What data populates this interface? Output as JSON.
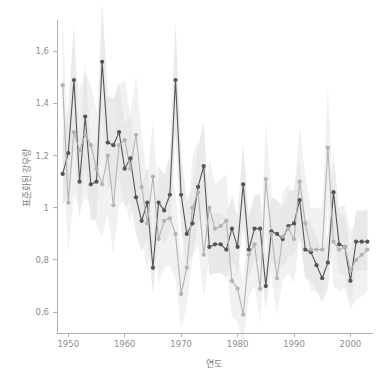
{
  "chart_data": {
    "type": "line",
    "title": "",
    "xlabel": "연도",
    "ylabel": "표준화된 강우량",
    "xlim": [
      1948,
      2004
    ],
    "ylim": [
      0.52,
      1.72
    ],
    "grid": false,
    "legend": "none",
    "decimal_separator": ",",
    "xticks": [
      1950,
      1960,
      1970,
      1980,
      1990,
      2000
    ],
    "xtick_labels": [
      "1950",
      "1960",
      "1970",
      "1980",
      "1990",
      "2000"
    ],
    "yticks": [
      0.6,
      0.8,
      1.0,
      1.2,
      1.4,
      1.6
    ],
    "ytick_labels": [
      "0,6",
      "0,8",
      "1",
      "1,2",
      "1,4",
      "1,6"
    ],
    "x": [
      1949,
      1950,
      1951,
      1952,
      1953,
      1954,
      1955,
      1956,
      1957,
      1958,
      1959,
      1960,
      1961,
      1962,
      1963,
      1964,
      1965,
      1966,
      1967,
      1968,
      1969,
      1970,
      1971,
      1972,
      1973,
      1974,
      1975,
      1976,
      1977,
      1978,
      1979,
      1980,
      1981,
      1982,
      1983,
      1984,
      1985,
      1986,
      1987,
      1988,
      1989,
      1990,
      1991,
      1992,
      1993,
      1994,
      1995,
      1996,
      1997,
      1998,
      1999,
      2000,
      2001,
      2002,
      2003
    ],
    "series": [
      {
        "name": "관측",
        "color": "#555555",
        "band_color": "#d8d8d8",
        "marker": "circle",
        "values": [
          1.13,
          1.21,
          1.49,
          1.1,
          1.35,
          1.09,
          1.1,
          1.56,
          1.25,
          1.24,
          1.29,
          1.15,
          1.19,
          1.04,
          0.95,
          1.02,
          0.77,
          1.02,
          0.99,
          1.05,
          1.49,
          1.05,
          0.9,
          0.94,
          1.08,
          1.16,
          0.85,
          0.86,
          0.86,
          0.84,
          0.92,
          0.85,
          1.09,
          0.84,
          0.92,
          0.92,
          0.7,
          0.91,
          0.9,
          0.88,
          0.93,
          0.94,
          1.03,
          0.84,
          0.83,
          0.78,
          0.73,
          0.79,
          1.06,
          0.86,
          0.85,
          0.72,
          0.87,
          0.87,
          0.87
        ],
        "band_lower": [
          1.01,
          1.05,
          1.28,
          0.96,
          1.16,
          0.95,
          0.96,
          1.33,
          1.08,
          1.07,
          1.12,
          1.0,
          1.03,
          0.9,
          0.83,
          0.89,
          0.67,
          0.89,
          0.86,
          0.91,
          1.28,
          0.91,
          0.78,
          0.82,
          0.94,
          1.0,
          0.74,
          0.75,
          0.75,
          0.73,
          0.8,
          0.74,
          0.94,
          0.73,
          0.8,
          0.8,
          0.61,
          0.79,
          0.78,
          0.77,
          0.81,
          0.82,
          0.89,
          0.73,
          0.72,
          0.68,
          0.64,
          0.69,
          0.92,
          0.75,
          0.74,
          0.63,
          0.76,
          0.76,
          0.76
        ],
        "band_upper": [
          1.26,
          1.38,
          1.71,
          1.25,
          1.55,
          1.24,
          1.25,
          1.79,
          1.43,
          1.42,
          1.48,
          1.32,
          1.36,
          1.19,
          1.08,
          1.16,
          0.88,
          1.16,
          1.13,
          1.2,
          1.71,
          1.2,
          1.03,
          1.07,
          1.23,
          1.33,
          0.97,
          0.98,
          0.98,
          0.96,
          1.05,
          0.97,
          1.25,
          0.96,
          1.05,
          1.05,
          0.8,
          1.04,
          1.03,
          1.0,
          1.06,
          1.07,
          1.18,
          0.96,
          0.95,
          0.89,
          0.83,
          0.9,
          1.21,
          0.98,
          0.97,
          0.82,
          0.99,
          0.99,
          0.99
        ]
      },
      {
        "name": "모의",
        "color": "#b3b3b3",
        "band_color": "#e6e6e6",
        "marker": "circle",
        "values": [
          1.47,
          1.02,
          1.29,
          1.22,
          1.28,
          1.24,
          1.15,
          1.09,
          1.2,
          1.01,
          1.24,
          1.26,
          1.15,
          1.28,
          1.08,
          0.94,
          1.12,
          0.88,
          0.95,
          0.96,
          0.9,
          0.67,
          0.77,
          1.0,
          1.06,
          0.82,
          1.0,
          0.92,
          0.93,
          0.95,
          0.72,
          0.69,
          0.59,
          0.82,
          0.86,
          0.69,
          1.11,
          0.9,
          0.73,
          0.89,
          0.92,
          0.88,
          1.1,
          0.94,
          0.84,
          0.84,
          0.84,
          1.23,
          0.87,
          0.84,
          0.85,
          0.76,
          0.8,
          0.82,
          0.84
        ],
        "band_lower": [
          1.2,
          0.83,
          1.05,
          0.99,
          1.04,
          1.01,
          0.93,
          0.89,
          0.98,
          0.82,
          1.01,
          1.03,
          0.94,
          1.05,
          0.88,
          0.76,
          0.91,
          0.71,
          0.77,
          0.78,
          0.73,
          0.54,
          0.62,
          0.81,
          0.86,
          0.66,
          0.81,
          0.75,
          0.75,
          0.77,
          0.58,
          0.56,
          0.47,
          0.66,
          0.7,
          0.56,
          0.9,
          0.73,
          0.59,
          0.72,
          0.75,
          0.71,
          0.89,
          0.76,
          0.68,
          0.68,
          0.68,
          1.0,
          0.7,
          0.68,
          0.69,
          0.61,
          0.65,
          0.66,
          0.68
        ],
        "band_upper": [
          1.74,
          1.21,
          1.53,
          1.45,
          1.52,
          1.47,
          1.37,
          1.29,
          1.42,
          1.2,
          1.47,
          1.49,
          1.36,
          1.51,
          1.28,
          1.12,
          1.33,
          1.05,
          1.13,
          1.14,
          1.07,
          0.8,
          0.92,
          1.19,
          1.26,
          0.98,
          1.19,
          1.09,
          1.11,
          1.13,
          0.86,
          0.82,
          0.71,
          0.98,
          1.02,
          0.82,
          1.32,
          1.07,
          0.87,
          1.06,
          1.09,
          1.05,
          1.31,
          1.12,
          1.0,
          1.0,
          1.0,
          1.46,
          1.04,
          1.0,
          1.01,
          0.91,
          0.95,
          0.98,
          1.0
        ]
      }
    ]
  },
  "axes": {
    "x_title": "연도",
    "y_title": "표준화된 강우량"
  }
}
